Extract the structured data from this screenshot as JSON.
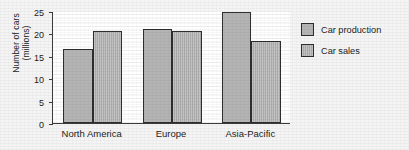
{
  "chart_data": {
    "type": "bar",
    "title": "",
    "xlabel": "",
    "ylabel": "Number of cars (millions)",
    "ylabel_lines": [
      "Number of cars",
      "(millions)"
    ],
    "categories": [
      "North America",
      "Europe",
      "Asia-Pacific"
    ],
    "series": [
      {
        "name": "Car production",
        "values": [
          16.5,
          21.0,
          24.7
        ],
        "color": "#b4b4b4"
      },
      {
        "name": "Car sales",
        "values": [
          20.6,
          20.5,
          18.2
        ],
        "color": "#ababab"
      }
    ],
    "ylim": [
      0,
      25
    ],
    "yticks": [
      0,
      5,
      10,
      15,
      20,
      25
    ],
    "ytick_labels": [
      "0",
      "5",
      "10",
      "15",
      "20",
      "25"
    ],
    "grid": false,
    "legend_position": "right",
    "axis_color": "#3b3b3b",
    "bar_border_color": "#2e2e2e",
    "plot_background": "#ffffff",
    "figure_background": "#f4f4f4"
  }
}
